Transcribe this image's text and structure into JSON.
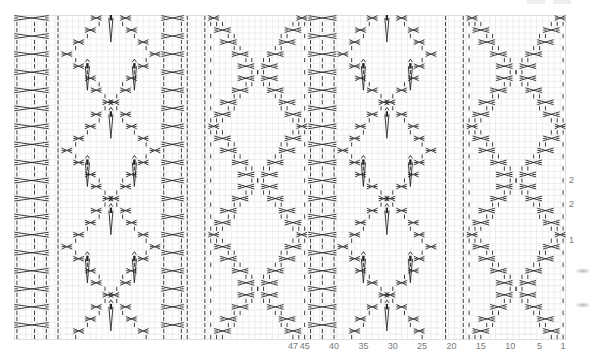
{
  "chart": {
    "type": "knitting-cable-chart",
    "stitch_count": 94,
    "row_count": 54,
    "colors": {
      "grid": "#dcdcdc",
      "symbol": "#222222",
      "border": "#c8c8c8",
      "label": "#777777"
    },
    "column_labels": [
      {
        "text": "47",
        "stitch": 47
      },
      {
        "text": "45",
        "stitch": 45
      },
      {
        "text": "40",
        "stitch": 40
      },
      {
        "text": "35",
        "stitch": 35
      },
      {
        "text": "30",
        "stitch": 30
      },
      {
        "text": "25",
        "stitch": 25
      },
      {
        "text": "20",
        "stitch": 20
      },
      {
        "text": "15",
        "stitch": 15
      },
      {
        "text": "10",
        "stitch": 10
      },
      {
        "text": "5",
        "stitch": 5
      },
      {
        "text": "1",
        "stitch": 1
      }
    ],
    "row_labels": [
      {
        "text": "2",
        "row": 27
      },
      {
        "text": "2",
        "row": 23
      },
      {
        "text": "1",
        "row": 17
      }
    ],
    "panels": [
      {
        "name": "diamond-cable",
        "start": 1,
        "end": 17
      },
      {
        "name": "purl-column",
        "start": 18,
        "end": 21
      },
      {
        "name": "lace-diamond",
        "start": 22,
        "end": 39
      },
      {
        "name": "braid-column",
        "start": 40,
        "end": 44
      },
      {
        "name": "diamond-cable",
        "start": 45,
        "end": 61
      },
      {
        "name": "purl-column",
        "start": 62,
        "end": 65
      },
      {
        "name": "braid-column",
        "start": 66,
        "end": 69
      },
      {
        "name": "lace-diamond",
        "start": 70,
        "end": 86
      },
      {
        "name": "purl-column",
        "start": 87,
        "end": 88
      },
      {
        "name": "braid-column",
        "start": 89,
        "end": 94
      }
    ],
    "symbols": {
      "purl": "vertical-dash",
      "cable-cross": "x-cross",
      "double-decrease": "arrow-with-wedge"
    }
  }
}
